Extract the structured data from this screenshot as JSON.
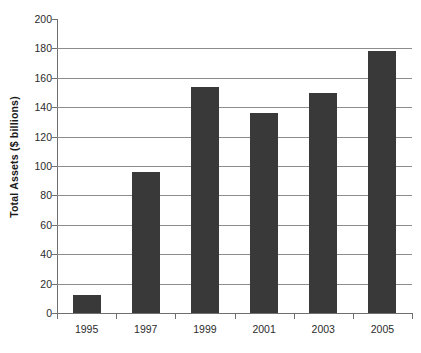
{
  "chart_data": {
    "type": "bar",
    "title": "",
    "subtitle": "",
    "xlabel": "",
    "ylabel": "Total Assets ($ billions)",
    "categories": [
      "1995",
      "1997",
      "1999",
      "2001",
      "2003",
      "2005"
    ],
    "values": [
      12,
      96,
      154,
      136,
      150,
      178
    ],
    "series": [
      {
        "name": "Total Assets",
        "values": [
          12,
          96,
          154,
          136,
          150,
          178
        ]
      }
    ],
    "ylim": [
      0,
      200
    ],
    "ytick_step": 20,
    "yticks": [
      0,
      20,
      40,
      60,
      80,
      100,
      120,
      140,
      160,
      180,
      200
    ],
    "ytick_labels": [
      "0",
      "20",
      "40",
      "60",
      "80",
      "100",
      "120",
      "140",
      "160",
      "180",
      "200"
    ],
    "grid": "horizontal",
    "legend": "none",
    "bar_color": "#393939",
    "gridline_color": "#8d8d8d",
    "axis_color": "#6f6f6f",
    "background_color": "#ffffff",
    "annotations": []
  }
}
